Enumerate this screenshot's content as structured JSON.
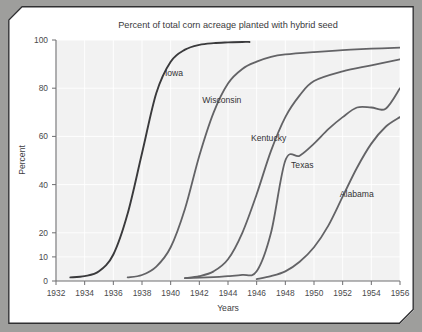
{
  "page": {
    "background_color": "#9e9e9c",
    "card_color": "#ffffff",
    "frame_color": "#2f2f31"
  },
  "chart_data": {
    "type": "line",
    "title": "Percent of total corn acreage planted with hybrid seed",
    "xlabel": "Years",
    "ylabel": "Percent",
    "xlim": [
      1932,
      1956
    ],
    "ylim": [
      0,
      100
    ],
    "grid": true,
    "legend": "inline-labels",
    "plot_background": "#f2f2f2",
    "gridline_color": "#ffffff",
    "xticks": [
      1932,
      1934,
      1936,
      1938,
      1940,
      1942,
      1944,
      1946,
      1948,
      1950,
      1952,
      1954,
      1956
    ],
    "xtick_labels": [
      "1932",
      "1934",
      "1936",
      "1938",
      "1940",
      "1942",
      "1944",
      "1946",
      "1948",
      "1950",
      "1952",
      "1954",
      "1956"
    ],
    "yticks": [
      0,
      10,
      20,
      40,
      60,
      80,
      100
    ],
    "ytick_labels": [
      "0",
      "10",
      "20",
      "40",
      "60",
      "80",
      "100"
    ],
    "series": [
      {
        "name": "Iowa",
        "color": "#3a3a3c",
        "label_x": 1939.6,
        "label_y": 85.0,
        "x": [
          1933,
          1934,
          1935,
          1936,
          1937,
          1938,
          1939,
          1940,
          1941,
          1942,
          1943,
          1944,
          1945,
          1945.5
        ],
        "values": [
          1.5,
          2,
          4,
          11,
          28,
          53,
          78,
          91,
          96,
          98,
          98.7,
          99,
          99.2,
          99.2
        ]
      },
      {
        "name": "Wisconsin",
        "color": "#636366",
        "label_x": 1942.2,
        "label_y": 74.0,
        "x": [
          1937,
          1938,
          1939,
          1940,
          1941,
          1942,
          1943,
          1944,
          1945,
          1946,
          1947,
          1948,
          1950,
          1952,
          1954,
          1956
        ],
        "values": [
          1.5,
          2.5,
          6,
          14,
          30,
          52,
          70,
          82,
          88,
          91,
          93,
          94,
          95,
          95.8,
          96.4,
          96.8
        ]
      },
      {
        "name": "Kentucky",
        "color": "#636366",
        "label_x": 1945.6,
        "label_y": 58.0,
        "x": [
          1941,
          1942,
          1943,
          1944,
          1945,
          1946,
          1947,
          1948,
          1949,
          1950,
          1952,
          1954,
          1956
        ],
        "values": [
          1.2,
          2,
          4,
          9,
          20,
          36,
          54,
          68,
          77,
          83,
          87,
          89.5,
          92
        ]
      },
      {
        "name": "Texas",
        "color": "#636366",
        "label_x": 1948.4,
        "label_y": 47.0,
        "x": [
          1941,
          1943,
          1944,
          1945,
          1946,
          1947,
          1948,
          1949,
          1950,
          1951,
          1952,
          1953,
          1954,
          1955,
          1956
        ],
        "values": [
          1.2,
          1.6,
          2,
          2.5,
          4,
          20,
          50,
          52,
          57,
          63,
          68,
          72,
          72,
          71.5,
          80
        ]
      },
      {
        "name": "Alabama",
        "color": "#636366",
        "label_x": 1951.8,
        "label_y": 35.0,
        "x": [
          1946,
          1947,
          1948,
          1949,
          1950,
          1951,
          1952,
          1953,
          1954,
          1955,
          1956
        ],
        "values": [
          0.8,
          2,
          4,
          8,
          14,
          23,
          35,
          47,
          57,
          64,
          68
        ]
      }
    ]
  }
}
